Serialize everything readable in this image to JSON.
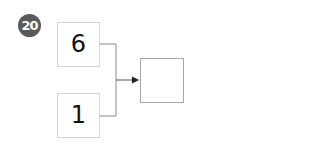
{
  "problem": {
    "number": "20",
    "inputs": [
      {
        "value": "6"
      },
      {
        "value": "1"
      }
    ],
    "result": {
      "value": ""
    }
  }
}
